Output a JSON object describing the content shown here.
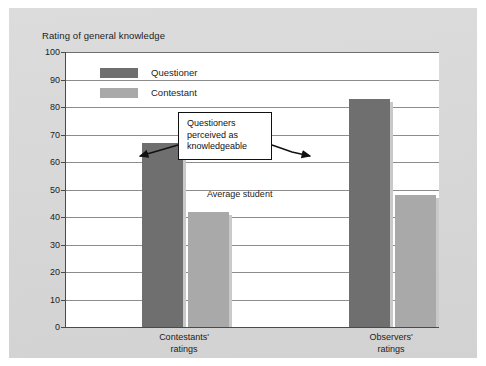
{
  "chart_data": {
    "type": "bar",
    "title": "Rating of general knowledge",
    "xlabel": "",
    "ylabel": "Rating of general knowledge",
    "ylim": [
      0,
      100
    ],
    "ytick_step": 10,
    "yticks": [
      "100",
      "90",
      "80",
      "70",
      "60",
      "50",
      "40",
      "30",
      "20",
      "10",
      "0"
    ],
    "grid": true,
    "legend_position": "top-left inside plot",
    "categories": [
      "Contestants' ratings",
      "Observers' ratings"
    ],
    "category_lines": [
      [
        "Contestants'",
        "ratings"
      ],
      [
        "Observers'",
        "ratings"
      ]
    ],
    "series": [
      {
        "name": "Questioner",
        "color": "#6f6f6f",
        "values": [
          67,
          83
        ]
      },
      {
        "name": "Contestant",
        "color": "#a9a9a9",
        "values": [
          42,
          48
        ]
      }
    ],
    "annotations": [
      {
        "id": "callout",
        "lines": [
          "Questioners",
          "perceived as",
          "knowledgeable"
        ],
        "arrows": [
          "left-to-questioner-bar-1",
          "right-to-questioner-bar-2"
        ]
      },
      {
        "id": "average-student-note",
        "text": "Average student"
      }
    ]
  },
  "colors": {
    "figure_background": "#ffffff",
    "panel_background": "#d8d8d8",
    "plot_background": "#ffffff",
    "axis": "#4a4a4a",
    "gridline": "#8d8d8d",
    "questioner": "#6f6f6f",
    "contestant": "#a9a9a9",
    "text": "#1c1c1c",
    "callout_border": "#111111"
  }
}
